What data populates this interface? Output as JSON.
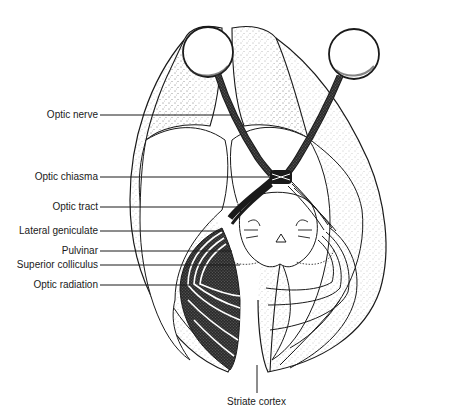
{
  "figure": {
    "colors": {
      "ink": "#1a1a1a",
      "paper": "#ffffff",
      "stipple": "#555555"
    }
  },
  "labels": {
    "optic_nerve": "Optic nerve",
    "optic_chiasma": "Optic chiasma",
    "optic_tract": "Optic tract",
    "lateral_geniculate": "Lateral geniculate",
    "pulvinar": "Pulvinar",
    "superior_colliculus": "Superior colliculus",
    "optic_radiation": "Optic radiation",
    "striate_cortex": "Striate cortex"
  }
}
